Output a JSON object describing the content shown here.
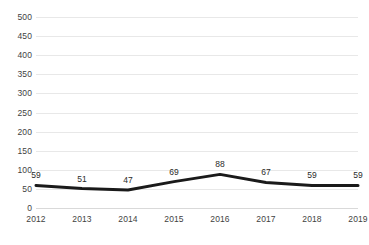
{
  "chart_data": {
    "type": "line",
    "title": "",
    "subtitle": "",
    "xlabel": "",
    "ylabel": "",
    "categories": [
      "2012",
      "2013",
      "2014",
      "2015",
      "2016",
      "2017",
      "2018",
      "2019"
    ],
    "values": [
      59,
      51,
      47,
      69,
      88,
      67,
      59,
      59
    ],
    "point_labels": [
      "59",
      "51",
      "47",
      "69",
      "88",
      "67",
      "59",
      "59"
    ],
    "ylim": [
      0,
      500
    ],
    "ytick_step": 50,
    "ytick_labels": [
      "0",
      "50",
      "100",
      "150",
      "200",
      "250",
      "300",
      "350",
      "400",
      "450",
      "500"
    ],
    "ytick_values": [
      0,
      50,
      100,
      150,
      200,
      250,
      300,
      350,
      400,
      450,
      500
    ],
    "grid": "horizontal",
    "legend": "none",
    "series_color": "#1a1a1a",
    "gridline_color": "#e8e8e8",
    "axis_text_color": "#3f3f3f",
    "label_text_color": "#2b2b2b",
    "background_color": "#ffffff"
  }
}
